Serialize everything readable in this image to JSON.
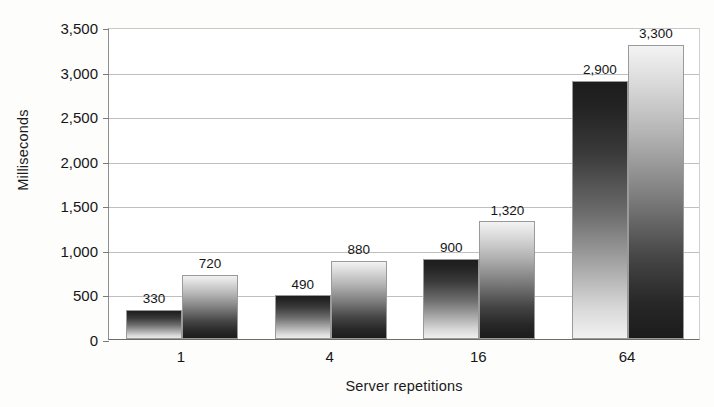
{
  "chart_data": {
    "type": "bar",
    "title": "",
    "xlabel": "Server repetitions",
    "ylabel": "Milliseconds",
    "categories": [
      "1",
      "4",
      "16",
      "64"
    ],
    "series": [
      {
        "name": "series-1",
        "values": [
          330,
          490,
          900,
          2900
        ],
        "gradient": "dark-top"
      },
      {
        "name": "series-2",
        "values": [
          720,
          880,
          1320,
          3300
        ],
        "gradient": "light-top"
      }
    ],
    "value_labels": [
      [
        "330",
        "490",
        "900",
        "2,900"
      ],
      [
        "720",
        "880",
        "1,320",
        "3,300"
      ]
    ],
    "ylim": [
      0,
      3500
    ],
    "ytick_values": [
      0,
      500,
      1000,
      1500,
      2000,
      2500,
      3000,
      3500
    ],
    "ytick_labels": [
      "0",
      "500",
      "1,000",
      "1,500",
      "2,000",
      "2,500",
      "3,000",
      "3,500"
    ],
    "grid": true,
    "grid_axis": "y",
    "legend": "none",
    "bar_colors": {
      "series_1_top": "#1c1c1c",
      "series_1_bottom": "#f2f2f2",
      "series_2_top": "#f4f4f4",
      "series_2_bottom": "#1b1b1b"
    },
    "axis_color": "#6d6d6d",
    "gridline_color": "#bfbfbf",
    "background": "#ffffff"
  }
}
